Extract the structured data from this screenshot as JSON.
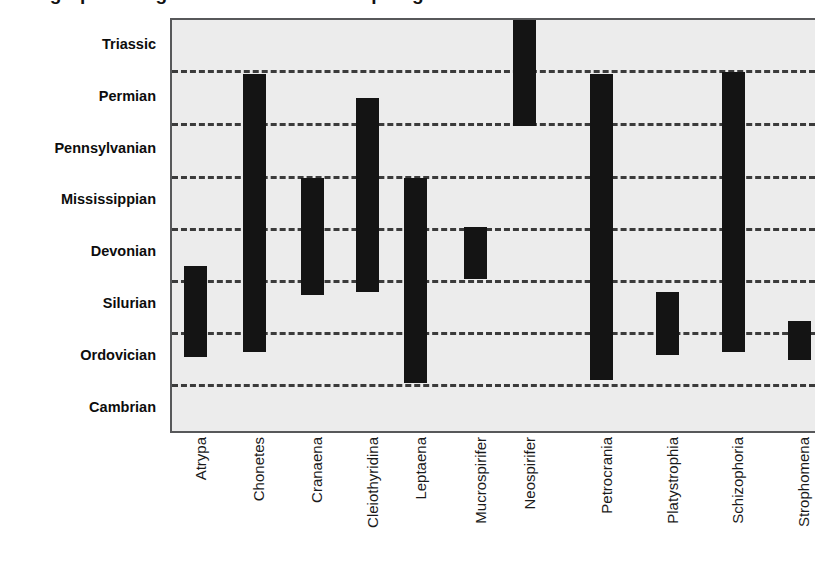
{
  "figure": {
    "clipped_title": "Stratigraphic ranges of selected brachiopod genera",
    "background_color": "#ececec",
    "bar_color": "#141414",
    "grid_color": "#3b3b3b",
    "frame_color": "#57585a"
  },
  "chart_data": {
    "type": "bar",
    "orientation": "vertical-range",
    "title": "",
    "xlabel": "",
    "ylabel": "",
    "grid": true,
    "legend": null,
    "y_categories": [
      "Cambrian",
      "Ordovician",
      "Silurian",
      "Devonian",
      "Mississippian",
      "Pennsylvanian",
      "Permian",
      "Triassic"
    ],
    "y_categories_top_to_bottom": [
      "Triassic",
      "Permian",
      "Pennsylvanian",
      "Mississippian",
      "Devonian",
      "Silurian",
      "Ordovician",
      "Cambrian"
    ],
    "categories": [
      "Atrypa",
      "Chonetes",
      "Cranaena",
      "Cleiothyridina",
      "Leptaena",
      "Mucrospirifer",
      "Neospirifer",
      "Petrocrania",
      "Platystrophia",
      "Schizophoria",
      "Strophomena"
    ],
    "note": "Each bar spans the stratigraphic range of one genus; band index 0 = Cambrian (bottom) through 7 = Triassic (top). Fractional values are positions within the 8 period bands.",
    "ranges": [
      {
        "genus": "Atrypa",
        "first_appearance": "Silurian",
        "last_appearance": "Devonian",
        "band_start": 1.5,
        "band_end": 3.25
      },
      {
        "genus": "Chonetes",
        "first_appearance": "Silurian",
        "last_appearance": "Permian",
        "band_start": 1.6,
        "band_end": 6.95
      },
      {
        "genus": "Cranaena",
        "first_appearance": "Devonian",
        "last_appearance": "Mississippian",
        "band_start": 2.7,
        "band_end": 4.95
      },
      {
        "genus": "Cleiothyridina",
        "first_appearance": "Devonian",
        "last_appearance": "Permian",
        "band_start": 2.75,
        "band_end": 6.5
      },
      {
        "genus": "Leptaena",
        "first_appearance": "Ordovician",
        "last_appearance": "Mississippian",
        "band_start": 1.0,
        "band_end": 4.95
      },
      {
        "genus": "Mucrospirifer",
        "first_appearance": "Devonian",
        "last_appearance": "Devonian",
        "band_start": 3.0,
        "band_end": 4.0
      },
      {
        "genus": "Neospirifer",
        "first_appearance": "Permian",
        "last_appearance": "Triassic",
        "band_start": 5.95,
        "band_end": 8.0
      },
      {
        "genus": "Petrocrania",
        "first_appearance": "Ordovician",
        "last_appearance": "Permian",
        "band_start": 1.05,
        "band_end": 6.95
      },
      {
        "genus": "Platystrophia",
        "first_appearance": "Ordovician",
        "last_appearance": "Silurian",
        "band_start": 1.55,
        "band_end": 2.75
      },
      {
        "genus": "Schizophoria",
        "first_appearance": "Silurian",
        "last_appearance": "Permian",
        "band_start": 1.6,
        "band_end": 7.0
      },
      {
        "genus": "Strophomena",
        "first_appearance": "Ordovician",
        "last_appearance": "Ordovician",
        "band_start": 1.45,
        "band_end": 2.2
      }
    ]
  },
  "geometry": {
    "plot_left": 170,
    "plot_top": 18,
    "plot_right": 815,
    "plot_bottom": 433,
    "band_height": 51.9,
    "bar_width": 23,
    "bar_centers": [
      193.5,
      252.0,
      310.0,
      365.5,
      413.5,
      473.5,
      522.5,
      599.5,
      665.5,
      731.0,
      797.0
    ],
    "gridlines_y": [
      68,
      121,
      174,
      226,
      278,
      330,
      382
    ]
  }
}
